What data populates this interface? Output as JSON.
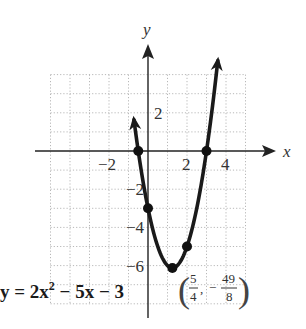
{
  "chart_data": {
    "type": "line",
    "title": "",
    "function": "y = 2x^2 - 5x - 3",
    "coefficients": {
      "a": 2,
      "b": -5,
      "c": -3
    },
    "xlabel": "x",
    "ylabel": "y",
    "xlim": [
      -5,
      5
    ],
    "ylim": [
      -8,
      4
    ],
    "grid": true,
    "x_tick_labels": [
      {
        "value": -2,
        "label": "−2"
      },
      {
        "value": 2,
        "label": "2"
      },
      {
        "value": 4,
        "label": "4"
      }
    ],
    "y_tick_labels": [
      {
        "value": 2,
        "label": "2"
      },
      {
        "value": -2,
        "label": "−2"
      },
      {
        "value": -4,
        "label": "−4"
      },
      {
        "value": -6,
        "label": "−6"
      }
    ],
    "curve_x_range": [
      -0.72,
      3.58
    ],
    "marked_points": [
      {
        "x": -0.5,
        "y": 0,
        "role": "x-intercept"
      },
      {
        "x": 3,
        "y": 0,
        "role": "x-intercept"
      },
      {
        "x": 0,
        "y": -3,
        "role": "y-intercept"
      },
      {
        "x": 1.25,
        "y": -6.125,
        "role": "vertex"
      },
      {
        "x": 2,
        "y": -5,
        "role": "point"
      }
    ],
    "equation_label": {
      "lhs": "y = 2x",
      "exp": "2",
      "rhs": " − 5x − 3"
    },
    "vertex_annotation": {
      "x_num": "5",
      "x_den": "4",
      "y_sign": "−",
      "y_num": "49",
      "y_den": "8",
      "comma": ","
    }
  }
}
